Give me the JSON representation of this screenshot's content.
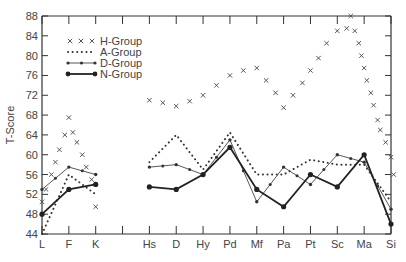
{
  "chart_data": {
    "type": "line",
    "title": "",
    "xlabel": "",
    "ylabel": "T-Score",
    "ylim": [
      44,
      88
    ],
    "yticks": [
      44,
      48,
      52,
      56,
      60,
      64,
      68,
      72,
      76,
      80,
      84,
      88
    ],
    "categories": [
      "L",
      "F",
      "K",
      "Hs",
      "D",
      "Hy",
      "Pd",
      "Mf",
      "Pa",
      "Pt",
      "Sc",
      "Ma",
      "Si"
    ],
    "category_positions": [
      0,
      1,
      2,
      4,
      5,
      6,
      7,
      8,
      9,
      10,
      11,
      12,
      13
    ],
    "grid": false,
    "legend_position": "top-left",
    "series": [
      {
        "name": "H-Group",
        "style": "crosses",
        "points": [
          [
            0,
            50.5
          ],
          [
            0.15,
            53
          ],
          [
            0.35,
            56
          ],
          [
            0.5,
            58.5
          ],
          [
            0.65,
            61
          ],
          [
            0.85,
            64
          ],
          [
            1.0,
            67.5
          ],
          [
            1.15,
            64.5
          ],
          [
            1.3,
            62.5
          ],
          [
            1.5,
            60
          ],
          [
            1.65,
            57.5
          ],
          [
            1.85,
            55
          ],
          [
            2.0,
            49.5
          ],
          [
            4,
            71
          ],
          [
            4.5,
            70.5
          ],
          [
            5,
            69.8
          ],
          [
            5.5,
            70.8
          ],
          [
            6,
            72
          ],
          [
            6.5,
            74
          ],
          [
            7,
            76
          ],
          [
            7.5,
            77
          ],
          [
            8,
            77.5
          ],
          [
            8.35,
            75
          ],
          [
            8.7,
            72.5
          ],
          [
            9,
            69.5
          ],
          [
            9.35,
            72
          ],
          [
            9.7,
            74.5
          ],
          [
            10,
            77
          ],
          [
            10.3,
            79.5
          ],
          [
            10.6,
            82.5
          ],
          [
            11,
            85
          ],
          [
            11.35,
            85.5
          ],
          [
            11.5,
            88
          ],
          [
            11.65,
            85
          ],
          [
            11.8,
            82.5
          ],
          [
            11.9,
            80
          ],
          [
            12.0,
            77.5
          ],
          [
            12.1,
            75
          ],
          [
            12.25,
            72.5
          ],
          [
            12.35,
            70
          ],
          [
            12.5,
            67
          ],
          [
            12.6,
            65
          ],
          [
            12.8,
            62.5
          ],
          [
            13.0,
            59.5
          ],
          [
            13.1,
            56
          ]
        ]
      },
      {
        "name": "A-Group",
        "style": "dotted",
        "segments": [
          {
            "x": [
              0,
              1,
              2
            ],
            "values": [
              44,
              56,
              52
            ]
          },
          {
            "x": [
              4,
              5,
              6,
              7,
              8,
              9,
              10,
              11,
              12,
              13
            ],
            "values": [
              58.5,
              64,
              57,
              64.5,
              56,
              56,
              59,
              58,
              58,
              50.5
            ]
          }
        ]
      },
      {
        "name": "D-Group",
        "style": "dash-dot",
        "segments": [
          {
            "x": [
              0,
              1,
              2
            ],
            "values": [
              53,
              57.5,
              56
            ]
          },
          {
            "x": [
              4,
              5,
              6,
              7,
              8,
              9,
              10,
              11,
              12,
              13
            ],
            "values": [
              57.5,
              58,
              56,
              63,
              50.5,
              57.5,
              54,
              60,
              58.5,
              49
            ]
          }
        ]
      },
      {
        "name": "N-Group",
        "style": "solid",
        "segments": [
          {
            "x": [
              0,
              1,
              2
            ],
            "values": [
              48,
              53,
              54
            ]
          },
          {
            "x": [
              4,
              5,
              6,
              7,
              8,
              9,
              10,
              11,
              12,
              13
            ],
            "values": [
              53.5,
              53,
              56,
              61.5,
              53,
              49.5,
              56,
              53.5,
              60,
              46
            ]
          }
        ]
      }
    ]
  }
}
